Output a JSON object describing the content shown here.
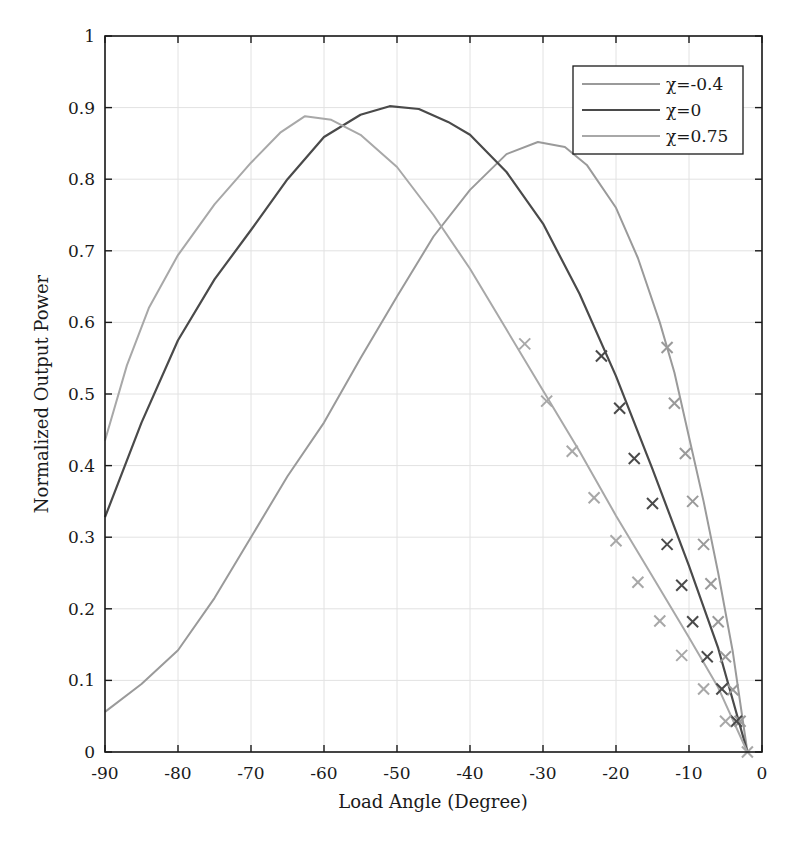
{
  "chart_data": {
    "type": "line",
    "title": "",
    "xlabel": "Load Angle (Degree)",
    "ylabel": "Normalized Output Power",
    "xlim": [
      -90,
      0
    ],
    "ylim": [
      0,
      1
    ],
    "xticks": [
      -90,
      -80,
      -70,
      -60,
      -50,
      -40,
      -30,
      -20,
      -10,
      0
    ],
    "yticks": [
      0,
      0.1,
      0.2,
      0.3,
      0.4,
      0.5,
      0.6,
      0.7,
      0.8,
      0.9,
      1
    ],
    "ytick_labels": [
      "0",
      "0.1",
      "0.2",
      "0.3",
      "0.4",
      "0.5",
      "0.6",
      "0.7",
      "0.8",
      "0.9",
      "1"
    ],
    "grid": true,
    "legend_position": "upper right",
    "series": [
      {
        "name": "χ=-0.4",
        "label": "χ=-0.4",
        "color": "#9a9a9a",
        "line": {
          "x": [
            -90,
            -85,
            -80,
            -75,
            -70,
            -65,
            -60,
            -55,
            -50,
            -45,
            -40,
            -35,
            -30.7,
            -27,
            -24,
            -20,
            -17,
            -14,
            -12,
            -10,
            -8,
            -6,
            -4,
            -2
          ],
          "y": [
            0.056,
            0.095,
            0.142,
            0.215,
            0.3,
            0.385,
            0.46,
            0.55,
            0.636,
            0.72,
            0.785,
            0.835,
            0.852,
            0.845,
            0.82,
            0.76,
            0.69,
            0.6,
            0.53,
            0.44,
            0.35,
            0.25,
            0.14,
            0.0
          ]
        },
        "markers": {
          "x": [
            -13,
            -12,
            -10.5,
            -9.5,
            -8,
            -7,
            -6,
            -5,
            -4,
            -3
          ],
          "y": [
            0.565,
            0.487,
            0.417,
            0.35,
            0.29,
            0.235,
            0.182,
            0.133,
            0.087,
            0.043
          ]
        }
      },
      {
        "name": "χ=0",
        "label": "χ=0",
        "color": "#4a4a4a",
        "line": {
          "x": [
            -90,
            -85,
            -80,
            -75,
            -70,
            -65,
            -60,
            -55,
            -51,
            -47,
            -43,
            -40,
            -35,
            -30,
            -25,
            -20,
            -15,
            -10,
            -6,
            -2
          ],
          "y": [
            0.328,
            0.46,
            0.575,
            0.66,
            0.729,
            0.8,
            0.859,
            0.89,
            0.902,
            0.898,
            0.88,
            0.862,
            0.81,
            0.738,
            0.64,
            0.525,
            0.395,
            0.26,
            0.145,
            0.0
          ]
        },
        "markers": {
          "x": [
            -22,
            -19.5,
            -17.5,
            -15,
            -13,
            -11,
            -9.5,
            -7.5,
            -5.5,
            -3.5
          ],
          "y": [
            0.553,
            0.48,
            0.41,
            0.347,
            0.29,
            0.233,
            0.182,
            0.133,
            0.088,
            0.043
          ]
        }
      },
      {
        "name": "χ=0.75",
        "label": "χ=0.75",
        "color": "#a8a8a8",
        "line": {
          "x": [
            -90,
            -87,
            -84,
            -80,
            -75,
            -70,
            -66,
            -62.6,
            -59,
            -55,
            -50,
            -45,
            -40,
            -35,
            -30,
            -25,
            -20,
            -15,
            -10,
            -6,
            -2
          ],
          "y": [
            0.435,
            0.54,
            0.62,
            0.694,
            0.765,
            0.823,
            0.865,
            0.888,
            0.883,
            0.862,
            0.817,
            0.75,
            0.675,
            0.59,
            0.505,
            0.42,
            0.33,
            0.245,
            0.16,
            0.09,
            0.0
          ]
        },
        "markers": {
          "x": [
            -32.5,
            -29.5,
            -26,
            -23,
            -20,
            -17,
            -14,
            -11,
            -8,
            -5,
            -2
          ],
          "y": [
            0.57,
            0.49,
            0.42,
            0.355,
            0.295,
            0.237,
            0.183,
            0.135,
            0.088,
            0.043,
            0.0
          ]
        }
      }
    ]
  },
  "axes": {
    "xlabel": "Load Angle (Degree)",
    "ylabel": "Normalized Output Power"
  },
  "legend": {
    "items": [
      {
        "label": "χ=-0.4",
        "color": "#9a9a9a"
      },
      {
        "label": "χ=0",
        "color": "#4a4a4a"
      },
      {
        "label": "χ=0.75",
        "color": "#a8a8a8"
      }
    ]
  }
}
